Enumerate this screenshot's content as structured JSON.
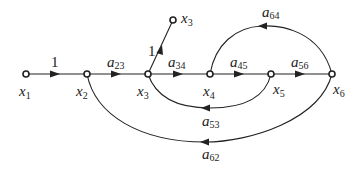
{
  "diagram": {
    "type": "signal-flow-graph",
    "nodes": [
      {
        "id": "x1",
        "label": "x",
        "sub": "1",
        "x": 26,
        "y": 74
      },
      {
        "id": "x2",
        "label": "x",
        "sub": "2",
        "x": 87,
        "y": 74
      },
      {
        "id": "x3",
        "label": "x",
        "sub": "3",
        "x": 148,
        "y": 74
      },
      {
        "id": "x4",
        "label": "x",
        "sub": "4",
        "x": 210,
        "y": 74
      },
      {
        "id": "x5",
        "label": "x",
        "sub": "5",
        "x": 271,
        "y": 74
      },
      {
        "id": "x6",
        "label": "x",
        "sub": "6",
        "x": 332,
        "y": 74
      },
      {
        "id": "x3out",
        "label": "x",
        "sub": "3",
        "x": 173,
        "y": 20
      }
    ],
    "edges": [
      {
        "from": "x1",
        "to": "x2",
        "gain": "1",
        "gain_main": "1",
        "gain_sub": ""
      },
      {
        "from": "x2",
        "to": "x3",
        "gain": "a23",
        "gain_main": "a",
        "gain_sub": "23"
      },
      {
        "from": "x3",
        "to": "x3out",
        "gain": "1",
        "gain_main": "1",
        "gain_sub": ""
      },
      {
        "from": "x3",
        "to": "x4",
        "gain": "a34",
        "gain_main": "a",
        "gain_sub": "34"
      },
      {
        "from": "x4",
        "to": "x5",
        "gain": "a45",
        "gain_main": "a",
        "gain_sub": "45"
      },
      {
        "from": "x5",
        "to": "x6",
        "gain": "a56",
        "gain_main": "a",
        "gain_sub": "56"
      },
      {
        "from": "x6",
        "to": "x4",
        "gain": "a64",
        "gain_main": "a",
        "gain_sub": "64"
      },
      {
        "from": "x5",
        "to": "x3",
        "gain": "a53",
        "gain_main": "a",
        "gain_sub": "53"
      },
      {
        "from": "x6",
        "to": "x2",
        "gain": "a62",
        "gain_main": "a",
        "gain_sub": "62"
      }
    ]
  }
}
